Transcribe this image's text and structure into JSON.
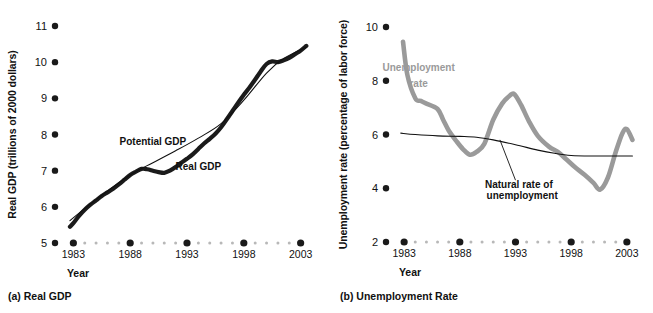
{
  "figure": {
    "panels": [
      {
        "id": "a",
        "caption": "(a) Real GDP",
        "xaxis_title": "Year",
        "yaxis_title": "Real GDP (trillions of 2000 dollars)"
      },
      {
        "id": "b",
        "caption": "(b) Unemployment Rate",
        "xaxis_title": "Year",
        "yaxis_title": "Unemployment rate (percentage of labor force)"
      }
    ]
  },
  "colors": {
    "ink": "#111111",
    "gray_series": "#9a9a9a",
    "tick_dot": "#1a1a1a",
    "minor_dot": "#b8b8b8",
    "background": "#ffffff"
  },
  "chart_data": [
    {
      "type": "line",
      "id": "real-gdp",
      "title": "(a) Real GDP",
      "xlabel": "Year",
      "ylabel": "Real GDP (trillions of 2000 dollars)",
      "xlim": [
        1982,
        2004
      ],
      "ylim": [
        5,
        11
      ],
      "yticks": [
        5,
        6,
        7,
        8,
        9,
        10,
        11
      ],
      "xticks": [
        1983,
        1988,
        1993,
        1998,
        2003
      ],
      "xticks_minor": [
        1984,
        1985,
        1986,
        1987,
        1989,
        1990,
        1991,
        1992,
        1994,
        1995,
        1996,
        1997,
        1999,
        2000,
        2001,
        2002
      ],
      "grid": false,
      "legend_position": "inline-annotations",
      "annotations": [
        {
          "text": "Potential GDP",
          "x": 1990.0,
          "y": 7.72
        },
        {
          "text": "Real GDP",
          "x": 1994.0,
          "y": 7.02
        }
      ],
      "series": [
        {
          "name": "Real GDP",
          "style": "thick-black",
          "x": [
            1982.7,
            1983.0,
            1983.5,
            1984.0,
            1984.5,
            1985.0,
            1985.5,
            1986.0,
            1986.5,
            1987.0,
            1987.5,
            1988.0,
            1988.5,
            1989.0,
            1989.5,
            1990.0,
            1990.5,
            1991.0,
            1991.5,
            1992.0,
            1992.5,
            1993.0,
            1993.5,
            1994.0,
            1994.5,
            1995.0,
            1995.5,
            1996.0,
            1996.5,
            1997.0,
            1997.5,
            1998.0,
            1998.5,
            1999.0,
            1999.5,
            2000.0,
            2000.5,
            2001.0,
            2001.5,
            2002.0,
            2002.5,
            2003.0,
            2003.5
          ],
          "y": [
            5.45,
            5.55,
            5.75,
            5.92,
            6.06,
            6.18,
            6.3,
            6.4,
            6.5,
            6.62,
            6.75,
            6.88,
            6.97,
            7.05,
            7.04,
            7.0,
            6.96,
            6.94,
            7.0,
            7.1,
            7.22,
            7.33,
            7.45,
            7.6,
            7.75,
            7.88,
            8.02,
            8.2,
            8.42,
            8.65,
            8.88,
            9.1,
            9.3,
            9.52,
            9.75,
            9.95,
            10.02,
            10.0,
            10.05,
            10.12,
            10.22,
            10.32,
            10.45
          ]
        },
        {
          "name": "Potential GDP",
          "style": "thin-black",
          "x": [
            1982.7,
            1985.0,
            1988.0,
            1990.0,
            1992.0,
            1994.0,
            1996.0,
            1998.0,
            2000.0,
            2001.5,
            2003.5
          ],
          "y": [
            5.62,
            6.2,
            6.88,
            7.22,
            7.55,
            7.9,
            8.3,
            8.95,
            9.7,
            10.1,
            10.42
          ]
        }
      ]
    },
    {
      "type": "line",
      "id": "unemployment-rate",
      "title": "(b) Unemployment Rate",
      "xlabel": "Year",
      "ylabel": "Unemployment rate (percentage of labor force)",
      "xlim": [
        1982,
        2004
      ],
      "ylim": [
        2,
        10
      ],
      "yticks": [
        2,
        4,
        6,
        8,
        10
      ],
      "xticks": [
        1983,
        1988,
        1993,
        1998,
        2003
      ],
      "xticks_minor": [
        1984,
        1985,
        1986,
        1987,
        1989,
        1990,
        1991,
        1992,
        1994,
        1995,
        1996,
        1997,
        1999,
        2000,
        2001,
        2002
      ],
      "grid": false,
      "legend_position": "inline-annotations",
      "annotations": [
        {
          "text": "Unemployment",
          "x": 1984.3,
          "y": 8.35
        },
        {
          "text": "rate",
          "x": 1984.3,
          "y": 7.75
        },
        {
          "text": "Natural rate of",
          "x": 1993.3,
          "y": 4.0
        },
        {
          "text": "unemployment",
          "x": 1993.6,
          "y": 3.6
        }
      ],
      "series": [
        {
          "name": "Unemployment rate",
          "style": "thick-gray",
          "x": [
            1982.9,
            1983.3,
            1984.0,
            1984.5,
            1985.0,
            1986.0,
            1986.5,
            1987.0,
            1987.7,
            1988.3,
            1988.9,
            1989.5,
            1990.2,
            1991.0,
            1991.8,
            1992.5,
            1992.9,
            1993.5,
            1994.2,
            1995.0,
            1996.0,
            1996.8,
            1997.5,
            1998.3,
            1999.2,
            2000.0,
            2000.6,
            2001.3,
            2002.0,
            2002.6,
            2003.0,
            2003.5
          ],
          "y": [
            9.45,
            8.2,
            7.35,
            7.25,
            7.15,
            6.95,
            6.55,
            6.15,
            5.75,
            5.45,
            5.25,
            5.35,
            5.65,
            6.55,
            7.15,
            7.45,
            7.5,
            7.1,
            6.5,
            5.95,
            5.55,
            5.35,
            5.1,
            4.8,
            4.5,
            4.2,
            3.95,
            4.4,
            5.35,
            6.05,
            6.2,
            5.8
          ]
        },
        {
          "name": "Natural rate of unemployment",
          "style": "thin-black",
          "x": [
            1982.7,
            1984.0,
            1986.0,
            1988.0,
            1989.5,
            1991.0,
            1993.0,
            1995.0,
            1996.5,
            1998.0,
            2000.0,
            2003.5
          ],
          "y": [
            6.05,
            6.0,
            5.95,
            5.93,
            5.9,
            5.8,
            5.62,
            5.42,
            5.3,
            5.22,
            5.2,
            5.2
          ]
        }
      ],
      "leader_lines": [
        {
          "from_x": 1993.0,
          "from_y": 4.3,
          "to_x": 1991.6,
          "to_y": 5.8
        }
      ]
    }
  ]
}
